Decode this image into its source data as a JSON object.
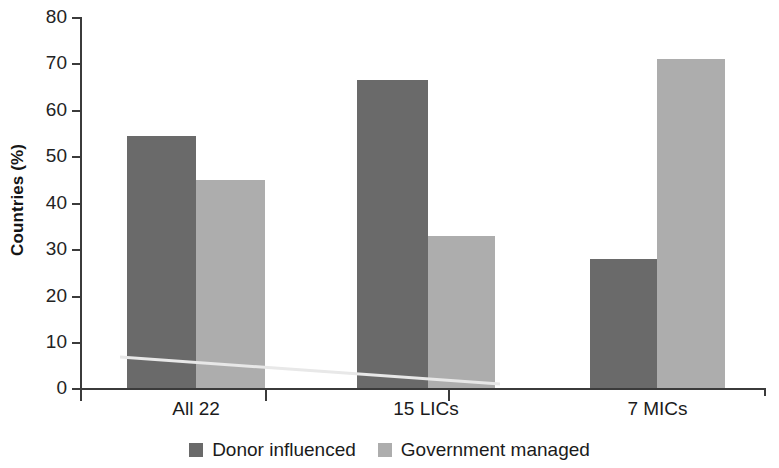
{
  "chart_data": {
    "type": "bar",
    "title": "",
    "subtitle": "",
    "xlabel": "",
    "ylabel": "Countries (%)",
    "categories": [
      "All 22",
      "15 LICs",
      "7 MICs"
    ],
    "series": [
      {
        "name": "Donor influenced",
        "values": [
          54.5,
          66.5,
          28
        ],
        "color": "#6a6a6a"
      },
      {
        "name": "Government managed",
        "values": [
          45,
          33,
          71
        ],
        "color": "#adadad"
      }
    ],
    "ylim": [
      0,
      80
    ],
    "yticks": [
      0,
      10,
      20,
      30,
      40,
      50,
      60,
      70,
      80
    ],
    "ytick_labels": [
      "0",
      "10",
      "20",
      "30",
      "40",
      "50",
      "60",
      "70",
      "80"
    ],
    "grid": false,
    "legend_position": "bottom",
    "annotations": []
  },
  "axes": {
    "y_title": "Countries (%)",
    "y_labels": {
      "t80": "80",
      "t70": "70",
      "t60": "60",
      "t50": "50",
      "t40": "40",
      "t30": "30",
      "t20": "20",
      "t10": "10",
      "t0": "0"
    },
    "x_labels": {
      "c0": "All 22",
      "c1": "15 LICs",
      "c2": "7 MICs"
    }
  },
  "legend": {
    "items": [
      {
        "label": "Donor influenced",
        "color": "#6a6a6a"
      },
      {
        "label": "Government managed",
        "color": "#adadad"
      }
    ]
  },
  "colors": {
    "dark_series": "#6a6a6a",
    "light_series": "#adadad",
    "axis": "#3b3b3b",
    "text": "#1b1b1b",
    "background": "#ffffff"
  }
}
